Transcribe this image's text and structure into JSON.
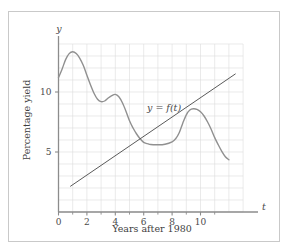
{
  "figure": {
    "border_color": "#c9c9c9",
    "background": "#ffffff"
  },
  "chart_data": {
    "type": "line",
    "title": "",
    "subtitle": "",
    "xlabel": "Years after 1980",
    "ylabel": "Percentage yield",
    "x_axis_variable": "t",
    "y_axis_variable": "y",
    "xlim": [
      0,
      12.6
    ],
    "ylim": [
      0,
      14.4
    ],
    "grid": true,
    "grid_color": "#dcdcdc",
    "grid_step_x": 1,
    "grid_step_y": 1,
    "grid_x_range": [
      0,
      13
    ],
    "grid_y_range": [
      0,
      14
    ],
    "axis_color": "#8c8c8c",
    "xticks": [
      0,
      2,
      4,
      6,
      8,
      10
    ],
    "xtick_labels": [
      "0",
      "2",
      "4",
      "6",
      "8",
      "10"
    ],
    "xminor_ticks": [
      1,
      3,
      5,
      7,
      9,
      11
    ],
    "yticks": [
      5,
      10
    ],
    "ytick_labels": [
      "5",
      "10"
    ],
    "legend": "none",
    "annotations": [
      {
        "text": "y = f(t)",
        "x": 5.0,
        "y": 8.6
      }
    ],
    "series": [
      {
        "name": "y = f(t)",
        "kind": "curve",
        "color": "#909090",
        "width": 1.4,
        "x": [
          0,
          0.25,
          0.5,
          0.75,
          1.0,
          1.25,
          1.5,
          1.75,
          2.0,
          2.25,
          2.5,
          2.75,
          3.0,
          3.25,
          3.5,
          3.75,
          4.0,
          4.25,
          4.5,
          4.75,
          5.0,
          5.25,
          5.5,
          5.75,
          6.0,
          6.25,
          6.5,
          7.0,
          7.5,
          8.0,
          8.25,
          8.5,
          8.75,
          9.0,
          9.25,
          9.5,
          9.75,
          10.0,
          10.25,
          10.5,
          10.75,
          11.0,
          11.25,
          11.5,
          11.75,
          12.0
        ],
        "y": [
          11.2,
          11.9,
          12.7,
          13.2,
          13.35,
          13.2,
          12.8,
          12.2,
          11.4,
          10.6,
          9.9,
          9.4,
          9.2,
          9.25,
          9.5,
          9.7,
          9.8,
          9.6,
          9.1,
          8.4,
          7.6,
          7.0,
          6.5,
          6.1,
          5.8,
          5.7,
          5.62,
          5.6,
          5.65,
          5.85,
          6.1,
          6.6,
          7.4,
          8.1,
          8.5,
          8.6,
          8.55,
          8.35,
          8.0,
          7.5,
          6.9,
          6.2,
          5.6,
          5.05,
          4.6,
          4.35
        ]
      },
      {
        "name": "secant line",
        "kind": "line",
        "color": "#5a5a5a",
        "width": 1.0,
        "x": [
          0.85,
          12.45
        ],
        "y": [
          2.15,
          11.5
        ]
      }
    ]
  }
}
